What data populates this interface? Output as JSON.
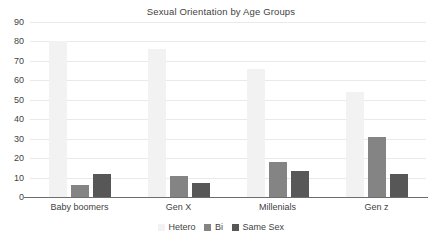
{
  "chart_data": {
    "type": "bar",
    "title": "Sexual Orientation by Age Groups",
    "xlabel": "",
    "ylabel": "",
    "ylim": [
      0,
      90
    ],
    "yticks": [
      0,
      10,
      20,
      30,
      40,
      50,
      60,
      70,
      80,
      90
    ],
    "ytick_labels": [
      "0",
      "10",
      "20",
      "30",
      "40",
      "50",
      "60",
      "70",
      "80",
      "90"
    ],
    "grid": true,
    "legend_position": "bottom-center",
    "categories": [
      "Baby boomers",
      "Gen X",
      "Millenials",
      "Gen z"
    ],
    "series": [
      {
        "name": "Hetero",
        "color": "#f2f2f2",
        "values": [
          80,
          76,
          66,
          54
        ]
      },
      {
        "name": "Bi",
        "color": "#848484",
        "values": [
          6,
          11,
          18,
          31
        ]
      },
      {
        "name": "Same Sex",
        "color": "#575757",
        "values": [
          12,
          7,
          13.5,
          12
        ]
      }
    ]
  },
  "legend": {
    "items": [
      {
        "label": "Hetero"
      },
      {
        "label": "Bi"
      },
      {
        "label": "Same Sex"
      }
    ]
  }
}
